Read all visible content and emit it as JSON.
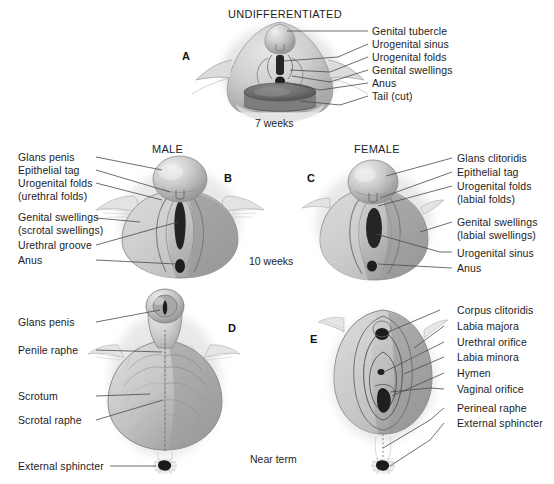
{
  "figure": {
    "kind": "embryology-diagram",
    "background": "#ffffff",
    "line_color": "#4a4a4a"
  },
  "stages": [
    {
      "id": "stage-7-weeks",
      "label": "7 weeks"
    },
    {
      "id": "stage-10-weeks",
      "label": "10 weeks"
    },
    {
      "id": "stage-near-term",
      "label": "Near term"
    }
  ],
  "panels": [
    {
      "id": "panel-a",
      "letter": "A",
      "title": "UNDIFFERENTIATED",
      "stage": "7 weeks",
      "label_side": "right",
      "labels": [
        "Genital tubercle",
        "Urogenital sinus",
        "Urogenital folds",
        "Genital swellings",
        "Anus",
        "Tail (cut)"
      ]
    },
    {
      "id": "panel-b",
      "letter": "B",
      "title": "MALE",
      "stage": "10 weeks",
      "label_side": "left",
      "labels": [
        "Glans penis",
        "Epithelial tag",
        "Urogenital folds",
        "(urethral folds)",
        "Genital swellings",
        "(scrotal swellings)",
        "Urethral groove",
        "Anus"
      ]
    },
    {
      "id": "panel-c",
      "letter": "C",
      "title": "FEMALE",
      "stage": "10 weeks",
      "label_side": "right",
      "labels": [
        "Glans clitoridis",
        "Epithelial tag",
        "Urogenital folds",
        "(labial folds)",
        "Genital swellings",
        "(labial swellings)",
        "Urogenital sinus",
        "Anus"
      ]
    },
    {
      "id": "panel-d",
      "letter": "D",
      "title": "",
      "stage": "Near term",
      "label_side": "left",
      "labels": [
        "Glans penis",
        "Penile raphe",
        "Scrotum",
        "Scrotal raphe",
        "External sphincter"
      ]
    },
    {
      "id": "panel-e",
      "letter": "E",
      "title": "",
      "stage": "Near term",
      "label_side": "right",
      "labels": [
        "Corpus clitoridis",
        "Labia majora",
        "Urethral orifice",
        "Labia minora",
        "Hymen",
        "Vaginal orifice",
        "Perineal raphe",
        "External sphincter"
      ]
    }
  ],
  "panel_a": {
    "title": "UNDIFFERENTIATED",
    "letter": "A",
    "stage": "7 weeks",
    "l1": "Genital tubercle",
    "l2": "Urogenital sinus",
    "l3": "Urogenital folds",
    "l4": "Genital swellings",
    "l5": "Anus",
    "l6": "Tail (cut)"
  },
  "panel_b": {
    "title": "MALE",
    "letter": "B",
    "l1": "Glans penis",
    "l2": "Epithelial tag",
    "l3": "Urogenital folds",
    "l3b": "(urethral folds)",
    "l4": "Genital swellings",
    "l4b": "(scrotal swellings)",
    "l5": "Urethral groove",
    "l6": "Anus"
  },
  "panel_c": {
    "title": "FEMALE",
    "letter": "C",
    "l1": "Glans clitoridis",
    "l2": "Epithelial tag",
    "l3": "Urogenital folds",
    "l3b": "(labial folds)",
    "l4": "Genital swellings",
    "l4b": "(labial swellings)",
    "l5": "Urogenital sinus",
    "l6": "Anus"
  },
  "panel_d": {
    "letter": "D",
    "l1": "Glans penis",
    "l2": "Penile raphe",
    "l3": "Scrotum",
    "l4": "Scrotal raphe",
    "l5": "External sphincter"
  },
  "panel_e": {
    "letter": "E",
    "l1": "Corpus clitoridis",
    "l2": "Labia majora",
    "l3": "Urethral orifice",
    "l4": "Labia minora",
    "l5": "Hymen",
    "l6": "Vaginal orifice",
    "l7": "Perineal raphe",
    "l8": "External sphincter"
  },
  "stage_middle": {
    "top": "7 weeks",
    "mid": "10 weeks",
    "bottom": "Near term"
  }
}
